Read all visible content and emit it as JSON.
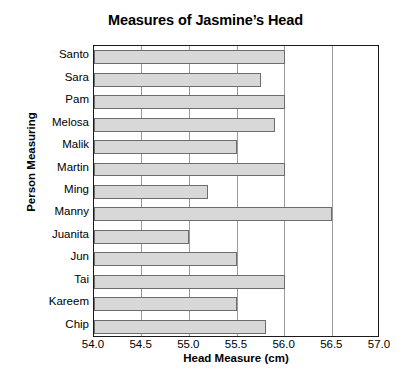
{
  "chart_data": {
    "type": "bar",
    "orientation": "horizontal",
    "title": "Measures of Jasmine’s Head",
    "xlabel": "Head Measure (cm)",
    "ylabel": "Person Measuring",
    "categories": [
      "Santo",
      "Sara",
      "Pam",
      "Melosa",
      "Malik",
      "Martin",
      "Ming",
      "Manny",
      "Juanita",
      "Jun",
      "Tai",
      "Kareem",
      "Chip"
    ],
    "values": [
      56.0,
      55.75,
      56.0,
      55.9,
      55.5,
      56.0,
      55.2,
      56.5,
      55.0,
      55.5,
      56.0,
      55.5,
      55.8
    ],
    "xlim": [
      54.0,
      57.0
    ],
    "xticks": [
      "54.0",
      "54.5",
      "55.0",
      "55.5",
      "56.0",
      "56.5",
      "57.0"
    ],
    "xtick_values": [
      54.0,
      54.5,
      55.0,
      55.5,
      56.0,
      56.5,
      57.0
    ],
    "grid": "vertical",
    "legend": "none",
    "bar_fill_color": "#d8d8d8",
    "bar_border_color": "#6d6d6d",
    "axis_color": "#1a1a1a",
    "gridline_color": "#9a9a9a"
  }
}
